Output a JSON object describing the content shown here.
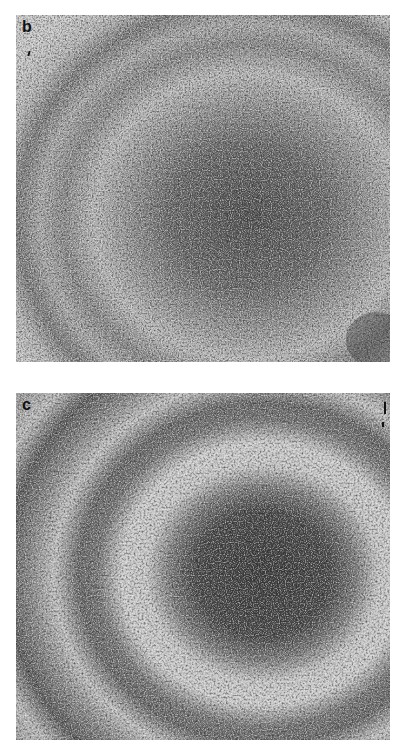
{
  "figure": {
    "panels": [
      {
        "id": "b",
        "label": "b",
        "description": "micrograph with concentric ring texture, dark central region lower-right"
      },
      {
        "id": "c",
        "label": "c",
        "description": "micrograph with concentric banded rings around dark circular core"
      }
    ],
    "colors": {
      "background": "#ffffff",
      "texture_light": "#e6e6e6",
      "texture_dark": "#3a3a3a",
      "label": "#111111"
    }
  }
}
